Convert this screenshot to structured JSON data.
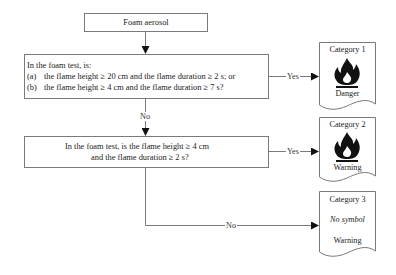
{
  "flowchart": {
    "start": {
      "label": "Foam aerosol"
    },
    "question1": {
      "intro": "In the foam test, is:",
      "option_a_marker": "(a)",
      "option_a_text": "the flame height  ≥ 20 cm and the flame duration ≥ 2 s; or",
      "option_b_marker": "(b)",
      "option_b_text": "the flame height  ≥ 4 cm and the flame duration ≥ 7 s?"
    },
    "question2": {
      "line1": "In the foam test, is the flame height  ≥ 4 cm",
      "line2": "and the flame duration ≥ 2 s?"
    },
    "edges": {
      "q1_yes": "Yes",
      "q1_no": "No",
      "q2_yes": "Yes",
      "q2_no": "No"
    },
    "categories": [
      {
        "title": "Category 1",
        "symbol": "flame-icon",
        "signal_word": "Danger"
      },
      {
        "title": "Category 2",
        "symbol": "flame-icon",
        "signal_word": "Warning"
      },
      {
        "title": "Category 3",
        "symbol_text": "No symbol",
        "signal_word": "Warning"
      }
    ],
    "colors": {
      "line": "#7a7a7a",
      "arrow": "#111111",
      "text": "#222222"
    }
  }
}
